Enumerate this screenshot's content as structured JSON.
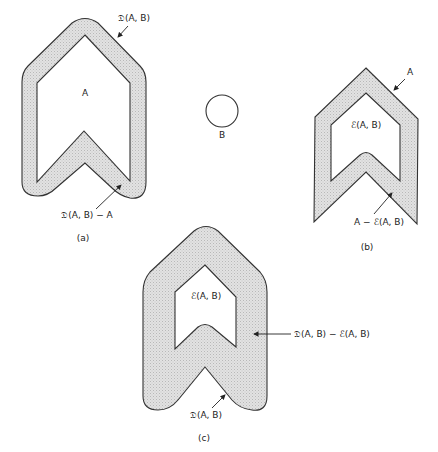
{
  "figure": {
    "panel_a": {
      "caption": "(a)",
      "inner_label": "A",
      "top_label": "𝔇(A, B)",
      "bottom_label": "𝔇(A, B) − A"
    },
    "structuring_element": {
      "label": "B"
    },
    "panel_b": {
      "caption": "(b)",
      "outer_label": "A",
      "inner_label": "ℰ(A, B)",
      "bottom_label": "A − ℰ(A, B)"
    },
    "panel_c": {
      "caption": "(c)",
      "inner_label": "ℰ(A, B)",
      "right_label": "𝔇(A, B) − ℰ(A, B)",
      "bottom_label": "𝔇(A, B)"
    },
    "colors": {
      "fill": "#dcdcdc",
      "stroke": "#333333",
      "background": "#ffffff"
    }
  }
}
